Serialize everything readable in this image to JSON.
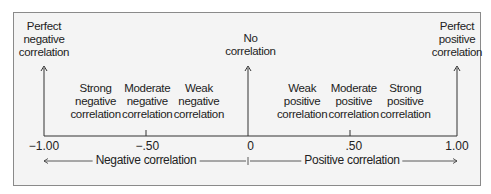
{
  "top_labels": [
    {
      "value": -1.0,
      "lines": [
        "Perfect",
        "negative",
        "correlation"
      ]
    },
    {
      "value": 0,
      "lines": [
        "No",
        "correlation"
      ]
    },
    {
      "value": 1.0,
      "lines": [
        "Perfect",
        "positive",
        "correlation"
      ]
    }
  ],
  "mid_labels": [
    {
      "value": -0.75,
      "lines": [
        "Strong",
        "negative",
        "correlation"
      ]
    },
    {
      "value": -0.5,
      "lines": [
        "Moderate",
        "negative",
        "correlation"
      ]
    },
    {
      "value": -0.25,
      "lines": [
        "Weak",
        "negative",
        "correlation"
      ]
    },
    {
      "value": 0.25,
      "lines": [
        "Weak",
        "positive",
        "correlation"
      ]
    },
    {
      "value": 0.5,
      "lines": [
        "Moderate",
        "positive",
        "correlation"
      ]
    },
    {
      "value": 0.75,
      "lines": [
        "Strong",
        "positive",
        "correlation"
      ]
    }
  ],
  "ticks": [
    {
      "value": -1.0,
      "label": "−1.00"
    },
    {
      "value": -0.5,
      "label": "−.50"
    },
    {
      "value": 0,
      "label": "0"
    },
    {
      "value": 0.5,
      "label": ".50"
    },
    {
      "value": 1.0,
      "label": "1.00"
    }
  ],
  "direction_labels": {
    "negative": "Negative correlation",
    "positive": "Positive correlation"
  },
  "colors": {
    "line": "#333333",
    "background": "#f4f4f4",
    "frame": "#8a8a8a"
  }
}
